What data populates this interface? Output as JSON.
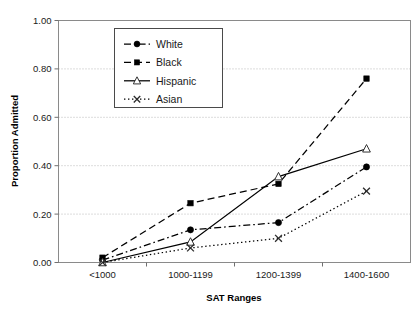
{
  "chart_data": {
    "type": "line",
    "title": "",
    "xlabel": "SAT Ranges",
    "ylabel": "Proportion Admitted",
    "categories": [
      "<1000",
      "1000-1199",
      "1200-1399",
      "1400-1600"
    ],
    "ylim": [
      0.0,
      1.0
    ],
    "ytick_labels": [
      "0.00",
      "0.20",
      "0.40",
      "0.60",
      "0.80",
      "1.00"
    ],
    "ytick_values": [
      0.0,
      0.2,
      0.4,
      0.6,
      0.8,
      1.0
    ],
    "grid": "horizontal-dotted",
    "legend_position": "upper-left-inside",
    "series": [
      {
        "name": "White",
        "values": [
          0.01,
          0.135,
          0.165,
          0.395
        ],
        "marker": "filled-circle",
        "line_style": "dash-dot",
        "color": "#000000"
      },
      {
        "name": "Black",
        "values": [
          0.02,
          0.245,
          0.325,
          0.76
        ],
        "marker": "filled-square",
        "line_style": "dashed",
        "color": "#000000"
      },
      {
        "name": "Hispanic",
        "values": [
          0.0,
          0.085,
          0.355,
          0.47
        ],
        "marker": "open-triangle",
        "line_style": "solid",
        "color": "#000000"
      },
      {
        "name": "Asian",
        "values": [
          0.0,
          0.06,
          0.1,
          0.295
        ],
        "marker": "cross-x",
        "line_style": "dotted",
        "color": "#000000"
      }
    ]
  },
  "axis": {
    "y_title": "Proportion Admitted",
    "x_title": "SAT Ranges"
  },
  "legend": {
    "entries": [
      {
        "label": "White"
      },
      {
        "label": "Black"
      },
      {
        "label": "Hispanic"
      },
      {
        "label": "Asian"
      }
    ]
  },
  "colors": {
    "ink": "#000000",
    "grid": "#b9b9b9",
    "frame": "#8a8a8a",
    "background": "#ffffff"
  }
}
